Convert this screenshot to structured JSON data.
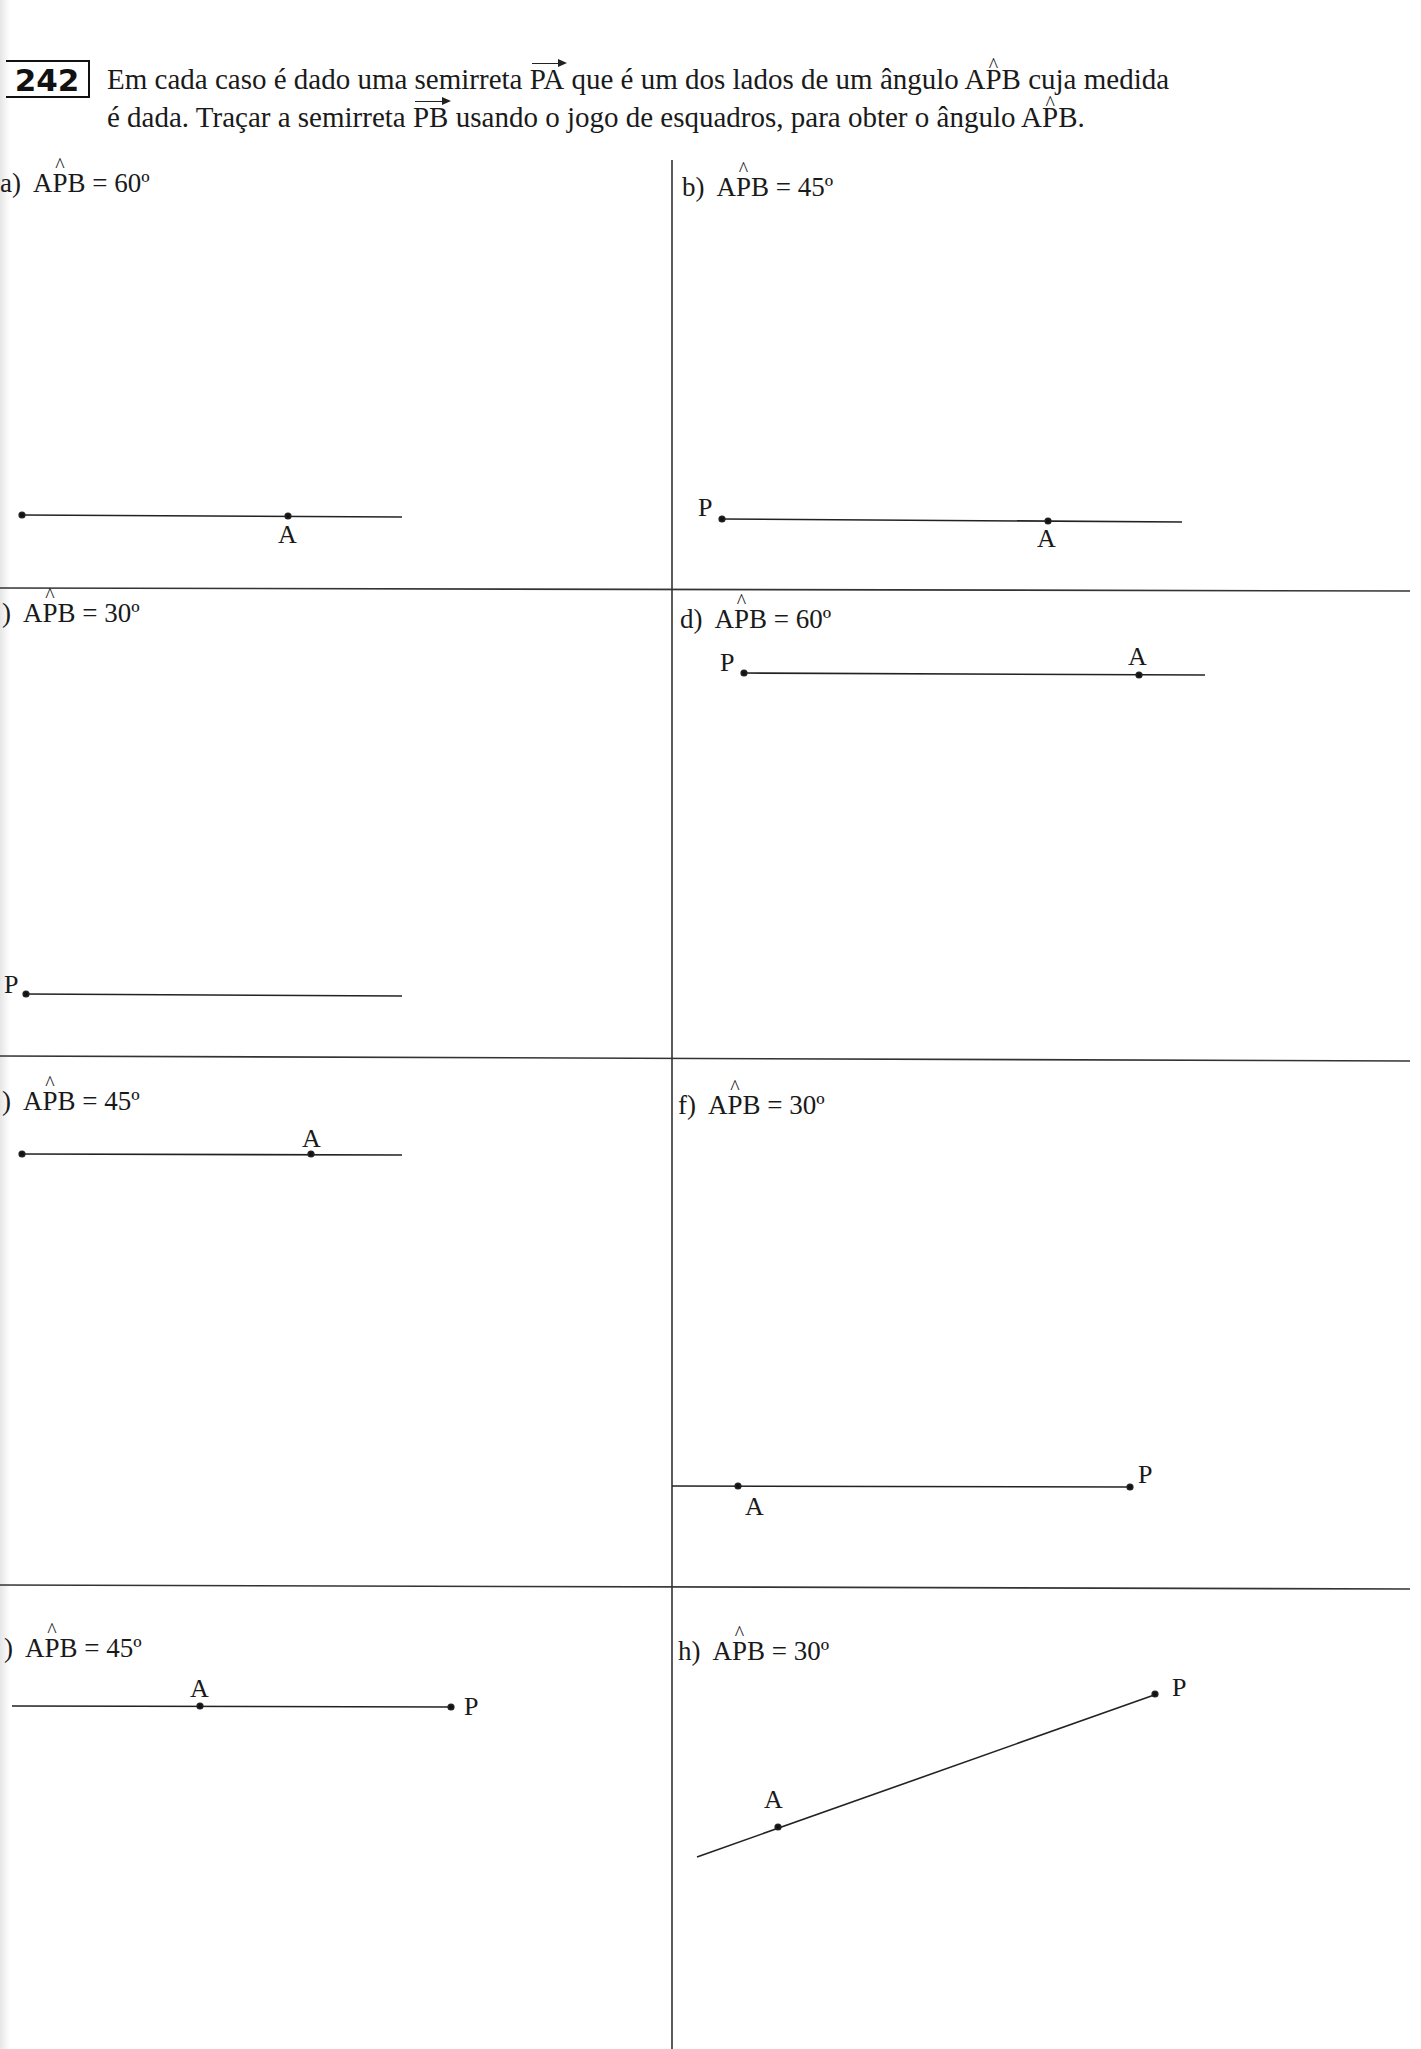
{
  "exercise": {
    "number": "242",
    "instruction_line1_parts": [
      "Em cada caso é dado uma semirreta ",
      "PA",
      " que é um dos lados de um ângulo A",
      "P",
      "B cuja medida"
    ],
    "instruction_line2_parts": [
      "é dada. Traçar a semirreta ",
      "PB",
      " usando o jogo de esquadros, para obter o ângulo A",
      "P",
      "B."
    ]
  },
  "items": [
    {
      "id": "a",
      "prefix": "a)",
      "angle_name_left": "A",
      "angle_name_vertex": "P",
      "angle_name_right": "B",
      "value": "= 60º",
      "points": {
        "P": "",
        "A": "A"
      }
    },
    {
      "id": "b",
      "prefix": "b)",
      "angle_name_left": "A",
      "angle_name_vertex": "P",
      "angle_name_right": "B",
      "value": "= 45º",
      "points": {
        "P": "P",
        "A": "A"
      }
    },
    {
      "id": "c",
      "prefix": ")",
      "angle_name_left": "A",
      "angle_name_vertex": "P",
      "angle_name_right": "B",
      "value": "= 30º",
      "points": {
        "P": "P"
      }
    },
    {
      "id": "d",
      "prefix": "d)",
      "angle_name_left": "A",
      "angle_name_vertex": "P",
      "angle_name_right": "B",
      "value": "= 60º",
      "points": {
        "P": "P",
        "A": "A"
      }
    },
    {
      "id": "e",
      "prefix": ")",
      "angle_name_left": "A",
      "angle_name_vertex": "P",
      "angle_name_right": "B",
      "value": "= 45º",
      "points": {
        "P": "",
        "A": "A"
      }
    },
    {
      "id": "f",
      "prefix": "f)",
      "angle_name_left": "A",
      "angle_name_vertex": "P",
      "angle_name_right": "B",
      "value": "= 30º",
      "points": {
        "P": "P",
        "A": "A"
      }
    },
    {
      "id": "g",
      "prefix": ")",
      "angle_name_left": "A",
      "angle_name_vertex": "P",
      "angle_name_right": "B",
      "value": "= 45º",
      "points": {
        "P": "P",
        "A": "A"
      }
    },
    {
      "id": "h",
      "prefix": "h)",
      "angle_name_left": "A",
      "angle_name_vertex": "P",
      "angle_name_right": "B",
      "value": "= 30º",
      "points": {
        "P": "P",
        "A": "A"
      }
    }
  ],
  "colors": {
    "ink": "#1a1a1a",
    "rule": "#333333",
    "paper": "#ffffff"
  }
}
